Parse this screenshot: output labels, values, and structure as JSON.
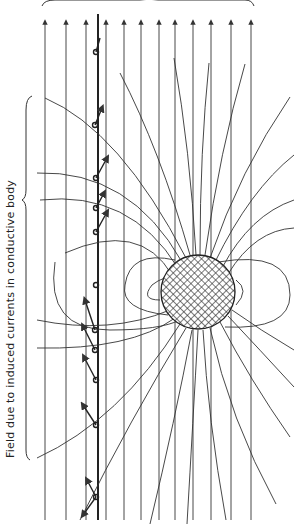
{
  "diagram": {
    "side_label": "Field due to induced currents in conductive body",
    "body": {
      "shape": "circle",
      "fill": "cross-hatch",
      "cx": 198,
      "cy": 292,
      "r": 37
    },
    "uniform_field_lines_x": [
      45,
      66,
      86,
      106,
      124,
      141,
      159,
      175,
      193,
      211,
      231,
      251
    ],
    "sensor_line_x": 98,
    "colors": {
      "line": "#333333",
      "background": "#ffffff"
    }
  }
}
